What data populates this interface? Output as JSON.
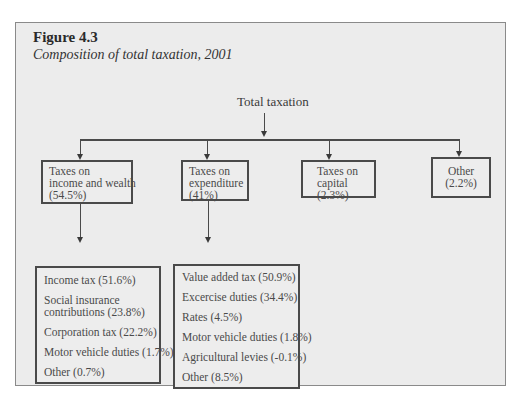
{
  "figure": {
    "label": "Figure 4.3",
    "caption": "Composition of total taxation, 2001"
  },
  "root": {
    "label": "Total taxation"
  },
  "categories": [
    {
      "lines": [
        "Taxes on",
        "income and wealth",
        "(54.5%)"
      ],
      "name": "Taxes on income and wealth",
      "share": "54.5%"
    },
    {
      "lines": [
        "Taxes on",
        "expenditure",
        "(41%)"
      ],
      "name": "Taxes on expenditure",
      "share": "41%"
    },
    {
      "lines": [
        "Taxes on",
        "capital",
        "(2.3%)"
      ],
      "name": "Taxes on capital",
      "share": "2.3%"
    },
    {
      "lines": [
        "Other",
        "(2.2%)"
      ],
      "name": "Other",
      "share": "2.2%"
    }
  ],
  "income_breakdown": [
    {
      "lines": [
        "Income tax (51.6%)"
      ]
    },
    {
      "lines": [
        "Social insurance",
        "contributions (23.8%)"
      ]
    },
    {
      "lines": [
        "Corporation tax (22.2%)"
      ]
    },
    {
      "lines": [
        "Motor vehicle duties (1.7%)"
      ]
    },
    {
      "lines": [
        "Other (0.7%)"
      ]
    }
  ],
  "expenditure_breakdown": [
    {
      "lines": [
        "Value added tax (50.9%)"
      ]
    },
    {
      "lines": [
        "Excercise duties (34.4%)"
      ]
    },
    {
      "lines": [
        "Rates (4.5%)"
      ]
    },
    {
      "lines": [
        "Motor vehicle duties (1.8%)"
      ]
    },
    {
      "lines": [
        "Agricultural levies (-0.1%)"
      ]
    },
    {
      "lines": [
        "Other (8.5%)"
      ]
    }
  ]
}
